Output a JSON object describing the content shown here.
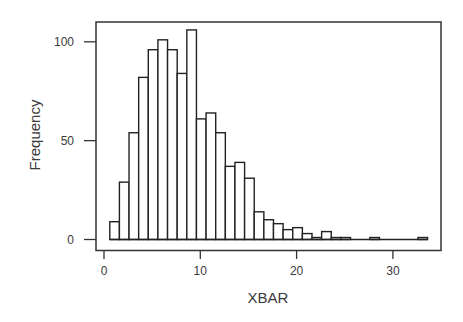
{
  "chart_data": {
    "type": "bar",
    "subtype": "histogram",
    "title": "",
    "xlabel": "XBAR",
    "ylabel": "Frequency",
    "xlim": [
      0,
      35
    ],
    "ylim": [
      0,
      110
    ],
    "xticks": [
      0,
      10,
      20,
      30
    ],
    "yticks": [
      0,
      50,
      100
    ],
    "grid": false,
    "legend": null,
    "bin_width": 1,
    "bin_start": 0.6,
    "categories": [
      1,
      2,
      3,
      4,
      5,
      6,
      7,
      8,
      9,
      10,
      11,
      12,
      13,
      14,
      15,
      16,
      17,
      18,
      19,
      20,
      21,
      22,
      23,
      24,
      25,
      26,
      27,
      28,
      29,
      30,
      31,
      32,
      33
    ],
    "values": [
      9,
      29,
      54,
      82,
      96,
      101,
      96,
      84,
      106,
      61,
      64,
      54,
      37,
      39,
      31,
      14,
      10,
      8,
      5,
      6,
      3,
      1,
      4,
      1,
      1,
      0,
      0,
      1,
      0,
      0,
      0,
      0,
      1
    ]
  },
  "colors": {
    "bar_fill": "#ffffff",
    "bar_stroke": "#222222",
    "axis": "#333333",
    "text": "#3a3a3a"
  }
}
